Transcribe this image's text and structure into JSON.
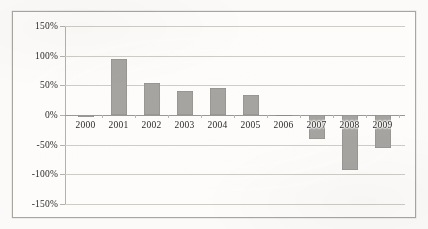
{
  "chart_data": {
    "type": "bar",
    "title": "",
    "subtitle": "",
    "xlabel": "",
    "ylabel": "",
    "categories": [
      "2000",
      "2001",
      "2002",
      "2003",
      "2004",
      "2005",
      "2006",
      "2007",
      "2008",
      "2009"
    ],
    "values": [
      -3,
      95,
      54,
      40,
      45,
      34,
      -2,
      -40,
      -92,
      -55
    ],
    "value_unit": "percent",
    "ylim": [
      -150,
      150
    ],
    "ytick_values": [
      150,
      100,
      50,
      0,
      -50,
      -100,
      -150
    ],
    "ytick_labels": [
      "150%",
      "100%",
      "50%",
      "0%",
      "-50%",
      "-100%",
      "-150%"
    ],
    "grid": true,
    "legend": false,
    "legend_position": "none",
    "series": [
      {
        "name": "",
        "values": [
          -3,
          95,
          54,
          40,
          45,
          34,
          -2,
          -40,
          -92,
          -55
        ]
      }
    ],
    "colors": {
      "bar": "#a6a4a1",
      "gridline": "#cfccc7",
      "axis": "#9b9894",
      "frame": "#a9a6a0",
      "text": "#2b2a28",
      "background": "#fdfcfa"
    }
  }
}
